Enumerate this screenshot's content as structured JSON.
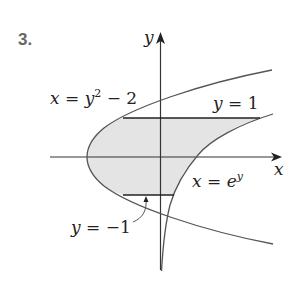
{
  "problem_number": "3.",
  "axes": {
    "x_label": "x",
    "y_label": "y"
  },
  "curves": [
    {
      "name": "parabola",
      "equation_lhs": "x = y",
      "equation_exp": "2",
      "equation_rhs": " − 2"
    },
    {
      "name": "exponential",
      "equation_lhs": "x = e",
      "equation_exp": "y"
    },
    {
      "name": "upper-line",
      "equation": "y = 1"
    },
    {
      "name": "lower-line",
      "equation": "y = −1"
    }
  ],
  "colors": {
    "stroke": "#555555",
    "fill": "#e4e4e4",
    "text": "#222222",
    "number": "#666666"
  }
}
